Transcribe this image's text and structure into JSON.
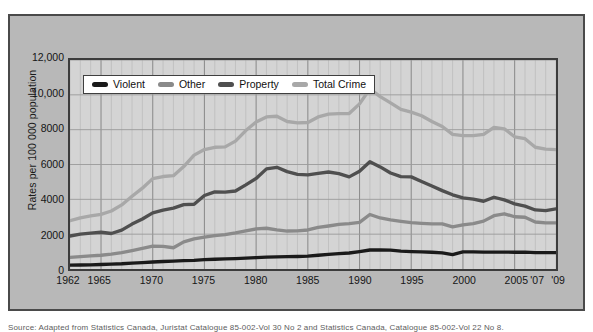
{
  "figure": {
    "caption": "Source: Adapted from Statistics Canada, Juristat Catalogue 85-002-Vol 30 No 2 and Statistics Canada, Catalogue 85-002-Vol 22 No 8.",
    "panel_color": "#b8b8b8",
    "plot_background": "#d4d4d4"
  },
  "legend": {
    "position": "inside-top-left",
    "items": [
      {
        "label": "Violent",
        "color": "#1a1a1a"
      },
      {
        "label": "Other",
        "color": "#8a8a8a"
      },
      {
        "label": "Property",
        "color": "#4f4f4f"
      },
      {
        "label": "Total Crime",
        "color": "#a8a8a8"
      }
    ]
  },
  "chart_data": {
    "type": "line",
    "title": "",
    "subtitle": "",
    "xlabel": "",
    "ylabel": "Rates per 100 000 population",
    "xlim": [
      1962,
      2009
    ],
    "ylim": [
      0,
      12000
    ],
    "grid": true,
    "y_ticks": [
      0,
      2000,
      4000,
      6000,
      8000,
      10000,
      12000
    ],
    "y_tick_labels": [
      "0",
      "2000",
      "4000",
      "6000",
      "8000",
      "10,000",
      "12,000"
    ],
    "x_ticks": [
      1962,
      1965,
      1970,
      1975,
      1980,
      1985,
      1990,
      1995,
      2000,
      2005,
      2007,
      2009
    ],
    "x_tick_labels": [
      "1962",
      "1965",
      "1970",
      "1975",
      "1980",
      "1985",
      "1990",
      "1995",
      "2000",
      "2005",
      "'07",
      "'09"
    ],
    "x": [
      1962,
      1963,
      1964,
      1965,
      1966,
      1967,
      1968,
      1969,
      1970,
      1971,
      1972,
      1973,
      1974,
      1975,
      1976,
      1977,
      1978,
      1979,
      1980,
      1981,
      1982,
      1983,
      1984,
      1985,
      1986,
      1987,
      1988,
      1989,
      1990,
      1991,
      1992,
      1993,
      1994,
      1995,
      1996,
      1997,
      1998,
      1999,
      2000,
      2001,
      2002,
      2003,
      2004,
      2005,
      2006,
      2007,
      2008,
      2009
    ],
    "series": [
      {
        "name": "Total Crime",
        "color": "#a8a8a8",
        "values": [
          2771,
          2940,
          3050,
          3140,
          3330,
          3680,
          4180,
          4640,
          5190,
          5310,
          5360,
          5880,
          6540,
          6860,
          6990,
          7010,
          7340,
          7950,
          8440,
          8730,
          8770,
          8470,
          8390,
          8410,
          8730,
          8890,
          8920,
          8930,
          9480,
          10342,
          9900,
          9540,
          9160,
          9010,
          8800,
          8470,
          8180,
          7730,
          7660,
          7660,
          7730,
          8130,
          8050,
          7590,
          7480,
          6990,
          6880,
          6850
        ]
      },
      {
        "name": "Property",
        "color": "#4f4f4f",
        "values": [
          1891,
          2000,
          2060,
          2110,
          2040,
          2230,
          2580,
          2870,
          3220,
          3380,
          3500,
          3700,
          3720,
          4220,
          4430,
          4410,
          4480,
          4830,
          5200,
          5750,
          5840,
          5590,
          5430,
          5400,
          5490,
          5570,
          5480,
          5290,
          5610,
          6160,
          5860,
          5510,
          5300,
          5290,
          5020,
          4760,
          4500,
          4260,
          4080,
          4010,
          3890,
          4120,
          3970,
          3740,
          3610,
          3390,
          3350,
          3450
        ]
      },
      {
        "name": "Other",
        "color": "#8a8a8a",
        "values": [
          668,
          710,
          750,
          790,
          850,
          940,
          1060,
          1180,
          1310,
          1300,
          1220,
          1560,
          1730,
          1830,
          1920,
          1970,
          2070,
          2190,
          2300,
          2340,
          2250,
          2180,
          2190,
          2240,
          2390,
          2470,
          2560,
          2610,
          2680,
          3130,
          2930,
          2820,
          2740,
          2660,
          2620,
          2590,
          2590,
          2420,
          2530,
          2600,
          2750,
          3060,
          3170,
          3000,
          2970,
          2700,
          2650,
          2650
        ]
      },
      {
        "name": "Violent",
        "color": "#1a1a1a",
        "values": [
          221,
          230,
          240,
          260,
          280,
          300,
          340,
          370,
          400,
          430,
          450,
          480,
          500,
          540,
          560,
          580,
          600,
          620,
          650,
          680,
          700,
          710,
          720,
          740,
          790,
          840,
          880,
          920,
          1000,
          1090,
          1090,
          1080,
          1030,
          1000,
          980,
          960,
          930,
          830,
          980,
          980,
          970,
          970,
          970,
          960,
          970,
          940,
          940,
          940
        ]
      }
    ]
  }
}
